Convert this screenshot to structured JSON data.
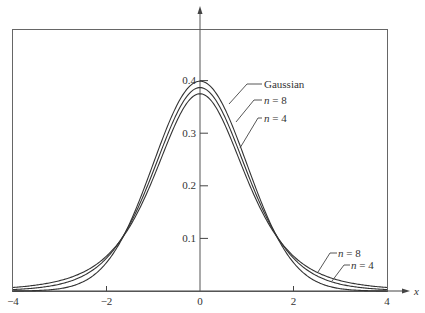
{
  "chart_data": {
    "type": "line",
    "title": "",
    "xlabel": "x",
    "ylabel": "",
    "xlim": [
      -4,
      4
    ],
    "ylim": [
      0,
      0.4
    ],
    "grid": false,
    "x_ticks": [
      "-4",
      "-2",
      "0",
      "2",
      "4"
    ],
    "y_ticks": [
      "0.1",
      "0.2",
      "0.3",
      "0.4"
    ],
    "series": [
      {
        "name": "Gaussian",
        "label": "Gaussian",
        "peak": 0.399,
        "x": [
          -4,
          -3,
          -2,
          -1.5,
          -1,
          -0.5,
          0,
          0.5,
          1,
          1.5,
          2,
          3,
          4
        ],
        "values": [
          0.0001,
          0.0044,
          0.054,
          0.1295,
          0.242,
          0.352,
          0.399,
          0.352,
          0.242,
          0.1295,
          0.054,
          0.0044,
          0.0001
        ]
      },
      {
        "name": "n = 8",
        "label": "n = 8",
        "peak": 0.387,
        "x": [
          -4,
          -3,
          -2,
          -1.5,
          -1,
          -0.5,
          0,
          0.5,
          1,
          1.5,
          2,
          3,
          4
        ],
        "values": [
          0.0041,
          0.0155,
          0.0646,
          0.1361,
          0.2326,
          0.3419,
          0.3867,
          0.3419,
          0.2326,
          0.1361,
          0.0646,
          0.0155,
          0.0041
        ]
      },
      {
        "name": "n = 4",
        "label": "n = 4",
        "peak": 0.375,
        "x": [
          -4,
          -3,
          -2,
          -1.5,
          -1,
          -0.5,
          0,
          0.5,
          1,
          1.5,
          2,
          3,
          4
        ],
        "values": [
          0.0067,
          0.0197,
          0.0663,
          0.1353,
          0.2147,
          0.3223,
          0.375,
          0.3223,
          0.2147,
          0.1353,
          0.0663,
          0.0197,
          0.0067
        ]
      }
    ],
    "annotations": [
      {
        "text": "Gaussian",
        "near": "peak, right side"
      },
      {
        "text": "n = 8",
        "near": "peak, right side"
      },
      {
        "text": "n = 4",
        "near": "peak, right side"
      },
      {
        "text": "n = 8",
        "near": "right tail"
      },
      {
        "text": "n = 4",
        "near": "right tail"
      }
    ]
  },
  "labels": {
    "x_axis": "x",
    "x_ticks": [
      "−4",
      "−2",
      "0",
      "2",
      "4"
    ],
    "y_ticks": [
      "0.1",
      "0.2",
      "0.3",
      "0.4"
    ],
    "top_gaussian": "Gaussian",
    "top_n8_var": "n",
    "top_n8_eq": " = 8",
    "top_n4_var": "n",
    "top_n4_eq": " = 4",
    "tail_n8_var": "n",
    "tail_n8_eq": " = 8",
    "tail_n4_var": "n",
    "tail_n4_eq": " = 4"
  },
  "colors": {
    "line": "#333333",
    "frame": "#555555"
  }
}
